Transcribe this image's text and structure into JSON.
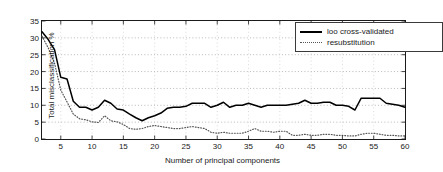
{
  "chart_data": {
    "type": "line",
    "title": "",
    "xlabel": "Number of principal components",
    "ylabel": "Total misclassification %",
    "xlim": [
      2,
      60
    ],
    "ylim": [
      0,
      35
    ],
    "xticks": [
      5,
      10,
      15,
      20,
      25,
      30,
      35,
      40,
      45,
      50,
      55,
      60
    ],
    "yticks": [
      0,
      5,
      10,
      15,
      20,
      25,
      30,
      35
    ],
    "grid": true,
    "grid_style": "dotted",
    "legend_position": "top-right",
    "x": [
      2,
      3,
      4,
      5,
      6,
      7,
      8,
      9,
      10,
      11,
      12,
      13,
      14,
      15,
      16,
      17,
      18,
      19,
      20,
      21,
      22,
      23,
      24,
      25,
      26,
      27,
      28,
      29,
      30,
      31,
      32,
      33,
      34,
      35,
      36,
      37,
      38,
      39,
      40,
      41,
      42,
      43,
      44,
      45,
      46,
      47,
      48,
      49,
      50,
      51,
      52,
      53,
      54,
      55,
      56,
      57,
      58,
      59,
      60
    ],
    "series": [
      {
        "name": "loo cross-validated",
        "style": "solid",
        "color": "#000000",
        "values": [
          31.8,
          29.5,
          26.5,
          18.3,
          17.8,
          11.2,
          9.4,
          9.4,
          8.6,
          9.4,
          11.5,
          10.6,
          8.9,
          8.6,
          7.4,
          6.3,
          5.4,
          6.3,
          6.9,
          7.7,
          9.1,
          9.4,
          9.4,
          9.7,
          10.6,
          10.6,
          10.6,
          9.4,
          10.0,
          10.9,
          9.4,
          10.0,
          10.0,
          10.6,
          10.0,
          9.4,
          10.0,
          10.0,
          10.0,
          10.0,
          10.3,
          10.6,
          11.5,
          10.6,
          10.6,
          10.9,
          10.9,
          10.0,
          10.0,
          9.7,
          8.6,
          12.1,
          12.1,
          12.1,
          12.1,
          10.6,
          10.3,
          10.0,
          9.4
        ]
      },
      {
        "name": "resubstitution",
        "style": "dotted",
        "color": "#555555",
        "values": [
          30.5,
          27.0,
          22.5,
          14.5,
          11.0,
          7.4,
          6.0,
          5.7,
          5.1,
          4.9,
          6.9,
          5.4,
          5.1,
          4.3,
          3.1,
          2.9,
          3.1,
          3.7,
          4.0,
          3.7,
          3.4,
          3.1,
          3.1,
          3.4,
          3.7,
          3.4,
          3.1,
          2.0,
          1.7,
          2.0,
          1.7,
          1.7,
          1.7,
          2.3,
          3.1,
          2.3,
          2.3,
          2.0,
          2.3,
          2.3,
          1.1,
          1.1,
          1.4,
          1.1,
          1.1,
          1.4,
          1.4,
          1.1,
          1.1,
          0.9,
          0.9,
          1.4,
          1.7,
          1.7,
          1.4,
          1.1,
          1.1,
          0.9,
          0.9
        ]
      }
    ]
  },
  "legend": {
    "items": [
      {
        "label": "loo cross-validated"
      },
      {
        "label": "resubstitution"
      }
    ]
  }
}
